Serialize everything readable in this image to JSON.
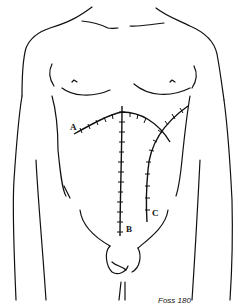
{
  "figure": {
    "type": "surgical incision diagram (anterior torso line drawing)",
    "labels": [
      {
        "id": "A",
        "text": "A",
        "description": "curved transverse (chevron/bilateral subcostal) incision across upper abdomen"
      },
      {
        "id": "B",
        "text": "B",
        "description": "vertical midline incision from xiphoid to below umbilicus"
      },
      {
        "id": "C",
        "text": "C",
        "description": "curved right paramedian / oblique incision"
      }
    ],
    "signature": "Foss 180",
    "colors": {
      "ink": "#111111",
      "background": "#ffffff"
    }
  }
}
